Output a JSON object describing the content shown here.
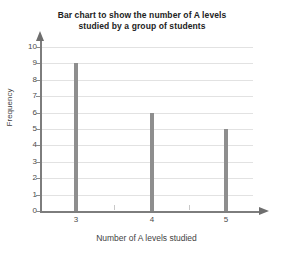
{
  "chart_data": {
    "type": "bar",
    "title": "Bar chart to show the number of A levels studied by a group of students",
    "title_lines": [
      "Bar chart to show the number of A levels",
      "studied by a group of students"
    ],
    "categories": [
      "3",
      "4",
      "5"
    ],
    "values": [
      9,
      6,
      5
    ],
    "xlabel": "Number of A levels studied",
    "ylabel": "Frequency",
    "ylim": [
      0,
      10
    ],
    "ytick_labels": [
      "0",
      "1",
      "2",
      "3",
      "4",
      "5",
      "6",
      "7",
      "8",
      "9",
      "10"
    ],
    "ytick_values": [
      0,
      1,
      2,
      3,
      4,
      5,
      6,
      7,
      8,
      9,
      10
    ],
    "xtick_labels": [
      "3",
      "4",
      "5"
    ],
    "grid": true,
    "grid_axis": "y",
    "legend": null,
    "legend_position": "none",
    "bar_color": "#8e8e8e",
    "grid_color": "#e2e2e2",
    "axis_color": "#7d7d7d",
    "background_color": "#ffffff",
    "text_color": "#3f3f3f",
    "x_axis_has_arrow": true,
    "y_axis_has_arrow": true,
    "minor_xticks": true
  }
}
